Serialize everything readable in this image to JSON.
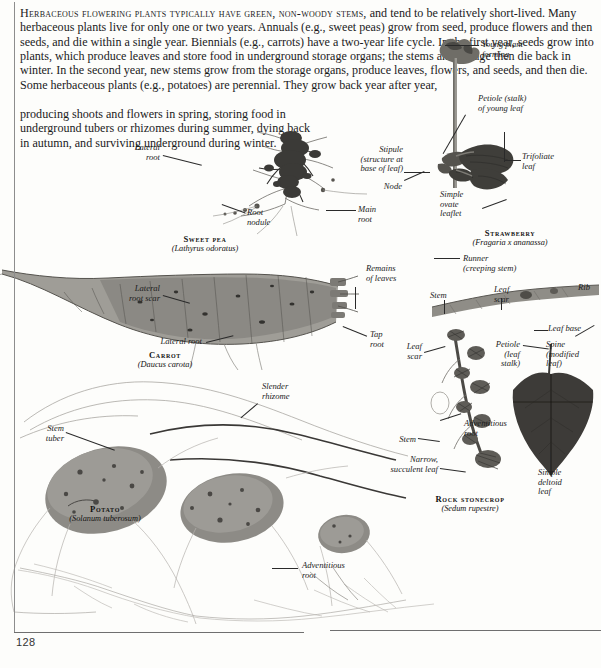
{
  "page": {
    "folio": "128",
    "intro_lead": "Herbaceous flowering plants typically have green, non-woody stems,",
    "intro_rest": " and tend to be relatively short-lived. Many herbaceous plants live for only one or two years. Annuals (e.g., sweet peas) grow from seed, produce flowers and then seeds, and die within a single year. Biennials (e.g., carrots) have a two-year life cycle. In the first year, seeds grow into plants, which produce leaves and store food in underground storage organs; the stems and foliage then die back in winter. In the second year, new stems grow from the storage organs, produce leaves, flowers, and seeds, and then die. Some herbaceous plants (e.g., potatoes) are perennial. They grow back year after year,",
    "intro_tail": "producing shoots and flowers in spring, storing food in underground tubers or rhizomes during summer, dying back in autumn, and surviving underground during winter."
  },
  "specimens": [
    {
      "common": "Sweet pea",
      "sci": "(Lathyrus odoratus)"
    },
    {
      "common": "Strawberry",
      "sci": "(Fragaria x ananassa)"
    },
    {
      "common": "Carrot",
      "sci": "(Daucus carota)"
    },
    {
      "common": "Potato",
      "sci": "(Solanum tuberosum)"
    },
    {
      "common": "Rock stonecrop",
      "sci": "(Sedum rupestre)"
    }
  ],
  "labels": {
    "sweetpea_lateral_root": "Lateral\nroot",
    "sweetpea_root_nodule": "Root\nnodule",
    "sweetpea_main_root": "Main\nroot",
    "straw_young_plant": "Young plant\nforming",
    "straw_petiole_young": "Petiole (stalk)\nof young leaf",
    "straw_trifoliate": "Trifoliate\nleaf",
    "straw_stipule": "Stipule\n(structure at\nbase of leaf)",
    "straw_node": "Node",
    "straw_simple_ovate": "Simple\novate\nleaflet",
    "straw_runner": "Runner\n(creeping stem)",
    "straw_stem": "Stem",
    "straw_leaf_scar": "Leaf\nscar",
    "straw_rib": "Rib",
    "carrot_remains_leaves": "Remains\nof leaves",
    "carrot_lateral_root_scar": "Lateral\nroot scar",
    "carrot_lateral_root": "Lateral root",
    "carrot_tap_root": "Tap\nroot",
    "potato_stem_tuber": "Stem\ntuber",
    "potato_slender_rhizome": "Slender\nrhizome",
    "potato_adventitious_root": "Adventitious\nroot",
    "sedum_leaf_scar": "Leaf\nscar",
    "sedum_stem": "Stem",
    "sedum_adventitious_root": "Adventitious\nroot",
    "sedum_narrow_leaf": "Narrow,\nsucculent leaf",
    "leaf_base": "Leaf base",
    "leaf_petiole": "Petiole\n(leaf\nstalk)",
    "leaf_spine": "Spine\n(modified\nleaf)",
    "leaf_simple_deltoid": "Simple\ndeltoid\nleaf"
  },
  "colors": {
    "page_background": "#fdfdfb",
    "text": "#1b1b1b",
    "rule": "#6f6f6f",
    "specimen_dark": "#3a3a38",
    "specimen_mid": "#8a8a86",
    "specimen_light": "#c9c9c4"
  }
}
